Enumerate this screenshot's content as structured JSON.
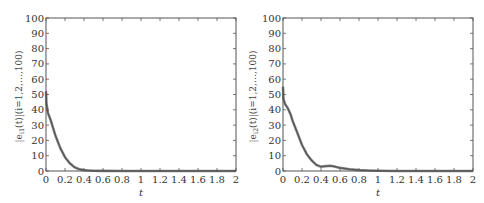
{
  "chart_data": [
    {
      "type": "line",
      "title": "",
      "xlabel": "t",
      "ylabel": "|e_{i1}(t)| (i=1,2,…,100)",
      "xlim": [
        0,
        2
      ],
      "ylim": [
        0,
        100
      ],
      "xticks": [
        "0",
        "0.2",
        "0.4",
        "0.6",
        "0.8",
        "1",
        "1.2",
        "1.4",
        "1.6",
        "1.8",
        "2"
      ],
      "yticks": [
        "0",
        "10",
        "20",
        "30",
        "40",
        "50",
        "60",
        "70",
        "80",
        "90",
        "100"
      ],
      "grid": false,
      "legend": null,
      "series": [
        {
          "name": "|e_i1(t)| envelope",
          "color": "#555555",
          "x": [
            0,
            0.005,
            0.02,
            0.05,
            0.08,
            0.1,
            0.15,
            0.2,
            0.25,
            0.3,
            0.35,
            0.4,
            0.45,
            0.5,
            0.6,
            0.8,
            1.0,
            1.5,
            2.0
          ],
          "y": [
            52,
            44,
            38,
            33,
            27,
            23,
            15,
            9,
            5,
            2.5,
            1.2,
            0.6,
            0.3,
            0.15,
            0.05,
            0,
            0,
            0,
            0
          ]
        }
      ]
    },
    {
      "type": "line",
      "title": "",
      "xlabel": "t",
      "ylabel": "|e_{i2}(t)| (i=1,2,…,100)",
      "xlim": [
        0,
        2
      ],
      "ylim": [
        0,
        100
      ],
      "xticks": [
        "0",
        "0.2",
        "0.4",
        "0.6",
        "0.8",
        "1",
        "1.2",
        "1.4",
        "1.6",
        "1.8",
        "2"
      ],
      "yticks": [
        "0",
        "10",
        "20",
        "30",
        "40",
        "50",
        "60",
        "70",
        "80",
        "90",
        "100"
      ],
      "grid": false,
      "legend": null,
      "series": [
        {
          "name": "|e_i2(t)| envelope",
          "color": "#555555",
          "x": [
            0,
            0.005,
            0.02,
            0.05,
            0.08,
            0.1,
            0.15,
            0.2,
            0.25,
            0.3,
            0.35,
            0.4,
            0.45,
            0.5,
            0.55,
            0.6,
            0.7,
            0.8,
            0.9,
            1.0,
            1.2,
            1.5,
            2.0
          ],
          "y": [
            55,
            47,
            44,
            41,
            37,
            33,
            25,
            17,
            11,
            7,
            4,
            2.8,
            3.2,
            3.4,
            2.8,
            2,
            1.2,
            0.6,
            0.3,
            0.1,
            0,
            0,
            0
          ]
        }
      ]
    }
  ],
  "figures": [
    {
      "ylabel_main": "|e",
      "ylabel_sub": "i1",
      "ylabel_rest": "(t)|(i=1,2,…,100)",
      "xlabel": "t"
    },
    {
      "ylabel_main": "|e",
      "ylabel_sub": "i2",
      "ylabel_rest": "(t)|(i=1,2,…,100)",
      "xlabel": "t"
    }
  ]
}
